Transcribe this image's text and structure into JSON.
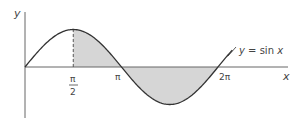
{
  "chart_data": {
    "type": "line",
    "title": "",
    "function_label": "y = sin x",
    "xlabel": "x",
    "ylabel": "y",
    "x_ticks": [
      {
        "value": 1.5708,
        "label_num": "π",
        "label_den": "2"
      },
      {
        "value": 3.1416,
        "label": "π"
      },
      {
        "value": 6.2832,
        "label": "2π"
      }
    ],
    "xlim": [
      0,
      6.8
    ],
    "ylim": [
      -1.05,
      1.05
    ],
    "series": [
      {
        "name": "y = sin x",
        "x_range": [
          0,
          6.8
        ],
        "function": "sin"
      }
    ],
    "shaded_regions": [
      {
        "from": 1.5708,
        "to": 3.1416,
        "description": "area under sin x between π/2 and π"
      },
      {
        "from": 3.1416,
        "to": 6.2832,
        "description": "area between sin x and x-axis from π to 2π"
      }
    ],
    "dashed_line": {
      "x": 1.5708,
      "from_y": 0,
      "to_y": 1
    },
    "grid": false,
    "legend": "none"
  },
  "colors": {
    "curve": "#333333",
    "axis": "#666666",
    "shade": "#d6d6d6",
    "text": "#444444"
  },
  "labels": {
    "y_axis": "y",
    "x_axis": "x",
    "pi_half_num": "π",
    "pi_half_den": "2",
    "pi": "π",
    "two_pi": "2π",
    "func": "y = sin x"
  }
}
